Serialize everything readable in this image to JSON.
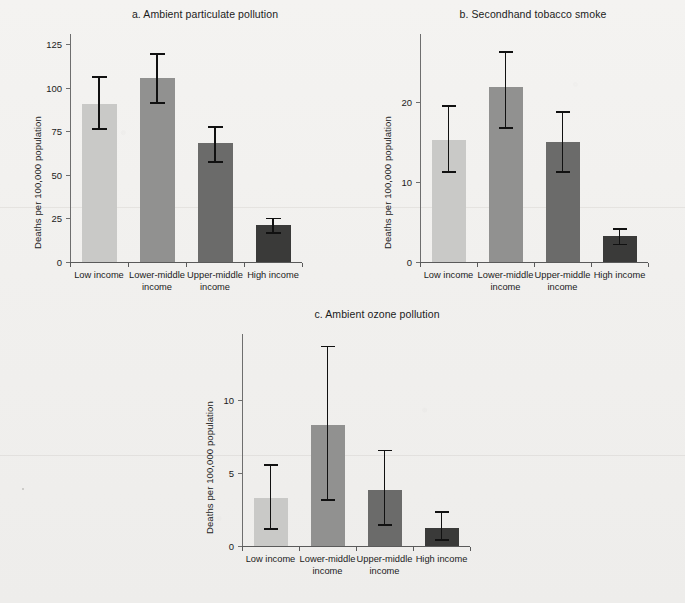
{
  "figure": {
    "shared_ylabel": "Deaths per 100,000 population",
    "shared_categories": [
      "Low income",
      "Lower-middle\nincome",
      "Upper-middle\nincome",
      "High income"
    ],
    "bar_colors": [
      "#c9c9c7",
      "#919190",
      "#6b6b6a",
      "#3a3a39"
    ],
    "error_color": "#111111",
    "axis_color": "#5a5a5a",
    "background": "#f1f0ee"
  },
  "chart_data": [
    {
      "id": "a",
      "type": "bar",
      "title": "a. Ambient particulate pollution",
      "xlabel": "",
      "ylabel": "Deaths per 100,000 population",
      "categories": [
        "Low income",
        "Lower-middle\nincome",
        "Upper-middle\nincome",
        "High income"
      ],
      "values": [
        91,
        106,
        68.5,
        21
      ],
      "error_low": [
        77,
        92,
        58,
        17
      ],
      "error_high": [
        107,
        120,
        78,
        25.5
      ],
      "yticks": [
        0,
        25,
        50,
        75,
        100,
        125
      ],
      "ylim": [
        0,
        131
      ],
      "grid": false,
      "legend": "none"
    },
    {
      "id": "b",
      "type": "bar",
      "title": "b. Secondhand tobacco smoke",
      "xlabel": "",
      "ylabel": "Deaths per 100,000 population",
      "categories": [
        "Low income",
        "Lower-middle\nincome",
        "Upper-middle\nincome",
        "High income"
      ],
      "values": [
        15.2,
        21.9,
        15.0,
        3.2
      ],
      "error_low": [
        11.4,
        16.9,
        11.4,
        2.3
      ],
      "error_high": [
        19.6,
        26.4,
        18.9,
        4.2
      ],
      "yticks": [
        0,
        10,
        20
      ],
      "ylim": [
        0,
        28.5
      ],
      "grid": false,
      "legend": "none"
    },
    {
      "id": "c",
      "type": "bar",
      "title": "c. Ambient ozone pollution",
      "xlabel": "",
      "ylabel": "Deaths per 100,000 population",
      "categories": [
        "Low income",
        "Lower-middle\nincome",
        "Upper-middle\nincome",
        "High income"
      ],
      "values": [
        3.3,
        8.3,
        3.8,
        1.25
      ],
      "error_low": [
        1.2,
        3.2,
        1.5,
        0.45
      ],
      "error_high": [
        5.6,
        13.7,
        6.6,
        2.4
      ],
      "yticks": [
        0,
        5,
        10
      ],
      "ylim": [
        0,
        14.5
      ],
      "grid": false,
      "legend": "none"
    }
  ]
}
